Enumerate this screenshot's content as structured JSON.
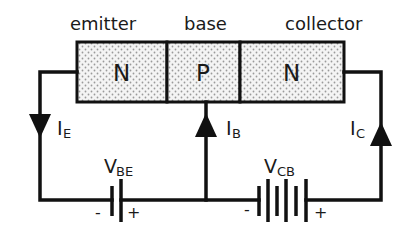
{
  "diagram": {
    "regions": [
      {
        "name": "emitter",
        "type": "N"
      },
      {
        "name": "base",
        "type": "P"
      },
      {
        "name": "collector",
        "type": "N"
      }
    ],
    "currents": {
      "emitter": {
        "main": "I",
        "sub": "E",
        "direction": "down"
      },
      "base": {
        "main": "I",
        "sub": "B",
        "direction": "up"
      },
      "collector": {
        "main": "I",
        "sub": "C",
        "direction": "up"
      }
    },
    "sources": {
      "vbe": {
        "main": "V",
        "sub": "BE",
        "neg": "-",
        "pos": "+"
      },
      "vcb": {
        "main": "V",
        "sub": "CB",
        "neg": "-",
        "pos": "+"
      }
    },
    "colors": {
      "line": "#111111",
      "fill": "#f2f2f2",
      "dot": "#9a9a9a",
      "background": "#ffffff"
    }
  }
}
